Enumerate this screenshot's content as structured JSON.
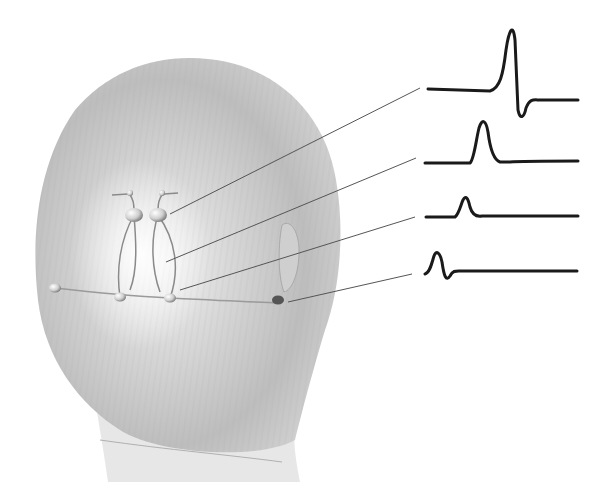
{
  "figure": {
    "colors": {
      "background": "#ffffff",
      "head_light": "#e6e6e6",
      "head_mid": "#c4c4c4",
      "head_dark": "#a8a8a8",
      "waveform": "#1a1a1a",
      "connector": "#555555"
    }
  },
  "waveforms": [
    {
      "id": "trace-1",
      "label": "",
      "baseline_y": 100,
      "peak_x": 510,
      "peak_y": 28,
      "trough_y": 117,
      "path": "M428,89 L490,91 C500,88 503,75 506,50 C509,30 513,22 515,40 L518,110 C520,120 524,118 526,108 C530,98 534,100 540,100 L578,100"
    },
    {
      "id": "trace-2",
      "label": "",
      "baseline_y": 162,
      "peak_x": 482,
      "peak_y": 122,
      "path": "M425,163 L470,163 C474,160 476,140 479,128 C482,118 486,120 488,132 C490,148 494,160 500,162 L510,162 C520,161 530,161 578,161"
    },
    {
      "id": "trace-3",
      "label": "",
      "baseline_y": 216,
      "peak_x": 464,
      "peak_y": 197,
      "path": "M426,217 L455,217 C459,214 461,204 463,200 C466,195 468,198 470,207 C472,214 476,217 482,216 L578,216"
    },
    {
      "id": "trace-4",
      "label": "",
      "baseline_y": 271,
      "peak_x": 436,
      "peak_y": 252,
      "path": "M425,274 C430,273 432,262 434,256 C436,250 440,252 442,262 C444,276 446,282 450,276 C453,270 456,271 462,271 L577,271"
    }
  ],
  "electrodes": [
    {
      "id": "electrode-upper-left",
      "x": 134,
      "y": 215
    },
    {
      "id": "electrode-upper-right",
      "x": 158,
      "y": 215
    },
    {
      "id": "electrode-lower-left",
      "x": 120,
      "y": 297
    },
    {
      "id": "electrode-lower-right",
      "x": 170,
      "y": 298
    },
    {
      "id": "electrode-ear-reference",
      "x": 278,
      "y": 300
    },
    {
      "id": "electrode-left-reference",
      "x": 55,
      "y": 288
    }
  ],
  "connectors": [
    {
      "id": "connector-1",
      "x1": 170,
      "y1": 214,
      "x2": 420,
      "y2": 88
    },
    {
      "id": "connector-2",
      "x1": 166,
      "y1": 262,
      "x2": 416,
      "y2": 158
    },
    {
      "id": "connector-3",
      "x1": 180,
      "y1": 290,
      "x2": 415,
      "y2": 217
    },
    {
      "id": "connector-4",
      "x1": 288,
      "y1": 302,
      "x2": 412,
      "y2": 274
    }
  ]
}
